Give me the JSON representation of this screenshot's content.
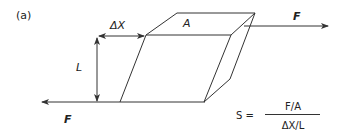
{
  "figure": {
    "panel_label": "(a)",
    "labels": {
      "delta_x": "ΔX",
      "area": "A",
      "length": "L",
      "force_top": "F",
      "force_bottom": "F"
    },
    "formula": {
      "lhs": "S =",
      "numerator": "F/A",
      "denominator": "ΔX/L"
    },
    "colors": {
      "line": "#333333",
      "background": "#ffffff"
    }
  }
}
